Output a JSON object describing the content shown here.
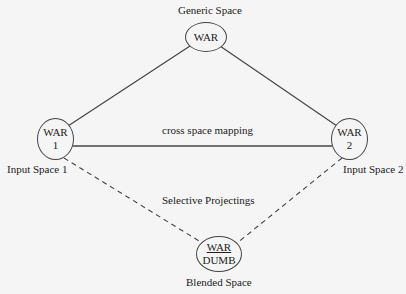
{
  "diagram": {
    "type": "conceptual-blending-network",
    "nodes": {
      "generic": {
        "line1": "WAR",
        "line2": "",
        "caption": "Generic Space"
      },
      "input1": {
        "line1": "WAR",
        "line2": "1",
        "caption": "Input Space 1"
      },
      "input2": {
        "line1": "WAR",
        "line2": "2",
        "caption": "Input Space 2"
      },
      "blend": {
        "line1": "WAR",
        "line2": "DUMB",
        "caption": "Blended Space"
      }
    },
    "edges": [
      {
        "from": "generic",
        "to": "input1",
        "style": "solid"
      },
      {
        "from": "generic",
        "to": "input2",
        "style": "solid"
      },
      {
        "from": "input1",
        "to": "input2",
        "style": "solid",
        "label": "cross space mapping"
      },
      {
        "from": "input1",
        "to": "blend",
        "style": "dashed"
      },
      {
        "from": "input2",
        "to": "blend",
        "style": "dashed"
      }
    ],
    "annotations": {
      "cross_mapping": "cross space mapping",
      "projection": "Selective Projectings"
    },
    "colors": {
      "line": "#444444",
      "background": "#f5f5f5",
      "text": "#222222"
    }
  }
}
